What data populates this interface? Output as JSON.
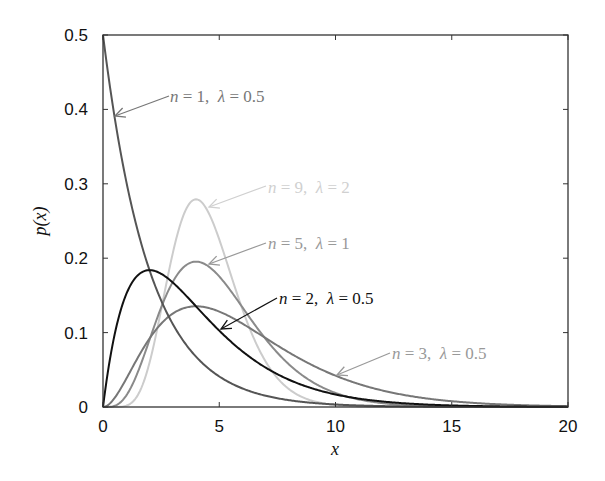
{
  "chart_data": {
    "type": "line",
    "title": "",
    "xlabel": "x",
    "ylabel": "p(x)",
    "xlim": [
      0,
      20
    ],
    "ylim": [
      0,
      0.5
    ],
    "xticks": [
      0,
      5,
      10,
      15,
      20
    ],
    "yticks": [
      0,
      0.1,
      0.2,
      0.3,
      0.4,
      0.5
    ],
    "xtick_labels": [
      "0",
      "5",
      "10",
      "15",
      "20"
    ],
    "ytick_labels": [
      "0",
      "0.1",
      "0.2",
      "0.3",
      "0.4",
      "0.5"
    ],
    "grid": false,
    "legend": "none (inline arrow annotations)",
    "distribution": "Erlang: p(x) = λ^n x^(n-1) e^(-λx) / (n-1)!",
    "series": [
      {
        "name": "n = 1, λ = 0.5",
        "n": 1,
        "lambda": 0.5,
        "color": "#555555",
        "peak_x": 0,
        "peak_y": 0.5,
        "x": [
          0,
          1,
          2,
          3,
          4,
          5,
          6,
          8,
          10,
          12,
          15,
          20
        ],
        "values": [
          0.5,
          0.303,
          0.184,
          0.112,
          0.068,
          0.041,
          0.025,
          0.009,
          0.003,
          0.001,
          0.0003,
          0.0
        ]
      },
      {
        "name": "n = 2, λ = 0.5",
        "n": 2,
        "lambda": 0.5,
        "color": "#111111",
        "peak_x": 2,
        "peak_y": 0.184,
        "x": [
          0,
          1,
          2,
          3,
          4,
          5,
          6,
          8,
          10,
          12,
          15,
          20
        ],
        "values": [
          0.0,
          0.152,
          0.184,
          0.167,
          0.135,
          0.103,
          0.075,
          0.037,
          0.017,
          0.007,
          0.002,
          0.0002
        ]
      },
      {
        "name": "n = 3, λ = 0.5",
        "n": 3,
        "lambda": 0.5,
        "color": "#777777",
        "peak_x": 4,
        "peak_y": 0.135,
        "x": [
          0,
          1,
          2,
          3,
          4,
          5,
          6,
          8,
          10,
          12,
          15,
          20
        ],
        "values": [
          0.0,
          0.038,
          0.092,
          0.126,
          0.135,
          0.128,
          0.112,
          0.073,
          0.042,
          0.022,
          0.008,
          0.001
        ]
      },
      {
        "name": "n = 5, λ = 1",
        "n": 5,
        "lambda": 1,
        "color": "#8a8a8a",
        "peak_x": 4,
        "peak_y": 0.195,
        "x": [
          0,
          1,
          2,
          3,
          4,
          5,
          6,
          8,
          10,
          12,
          15,
          20
        ],
        "values": [
          0.0,
          0.015,
          0.09,
          0.168,
          0.195,
          0.175,
          0.134,
          0.057,
          0.019,
          0.005,
          0.001,
          0.0
        ]
      },
      {
        "name": "n = 9, λ = 2",
        "n": 9,
        "lambda": 2,
        "color": "#cccccc",
        "peak_x": 4,
        "peak_y": 0.279,
        "x": [
          0,
          1,
          2,
          3,
          4,
          5,
          6,
          8,
          10,
          12,
          15,
          20
        ],
        "values": [
          0.0,
          0.001,
          0.06,
          0.206,
          0.279,
          0.226,
          0.128,
          0.019,
          0.001,
          0.0001,
          0.0,
          0.0
        ]
      }
    ],
    "annotations": [
      {
        "text_n": "n",
        "text_rest1": " = 1,  ",
        "text_lambda": "λ",
        "text_rest2": " = 0.5",
        "color": "#777777"
      },
      {
        "text_n": "n",
        "text_rest1": " = 9,  ",
        "text_lambda": "λ",
        "text_rest2": " = 2",
        "color": "#d0d0d0"
      },
      {
        "text_n": "n",
        "text_rest1": " = 5,  ",
        "text_lambda": "λ",
        "text_rest2": " = 1",
        "color": "#999999"
      },
      {
        "text_n": "n",
        "text_rest1": " = 2,  ",
        "text_lambda": "λ",
        "text_rest2": " = 0.5",
        "color": "#111111"
      },
      {
        "text_n": "n",
        "text_rest1": " = 3,  ",
        "text_lambda": "λ",
        "text_rest2": " = 0.5",
        "color": "#999999"
      }
    ]
  }
}
